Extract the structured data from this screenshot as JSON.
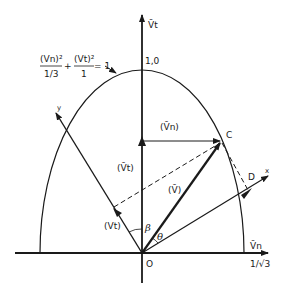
{
  "figure": {
    "type": "vector-diagram",
    "equation": {
      "term1_numerator": "(Vn)²",
      "term1_denominator": "1/3",
      "plus": "+",
      "term2_numerator": "(Vt)²",
      "term2_denominator": "1",
      "rhs": "= 1"
    },
    "axes": {
      "vertical_label": "V̄t",
      "horizontal_label": "V̄n",
      "vertical_intercept_label": "1,0",
      "horizontal_intercept_label": "1/√3",
      "origin_label": "O",
      "rotated_x_label": "x",
      "rotated_y_label": "y"
    },
    "points": {
      "C": "C",
      "D": "D"
    },
    "vectors": {
      "v_bar": "(V̄)",
      "vn_bar": "(V̄n)",
      "vt_bar": "(V̄t)",
      "vt": "(Vt)"
    },
    "angles": {
      "beta": "β",
      "theta": "θ"
    },
    "colors": {
      "ink": "#1a1a1a",
      "background": "#ffffff"
    }
  }
}
